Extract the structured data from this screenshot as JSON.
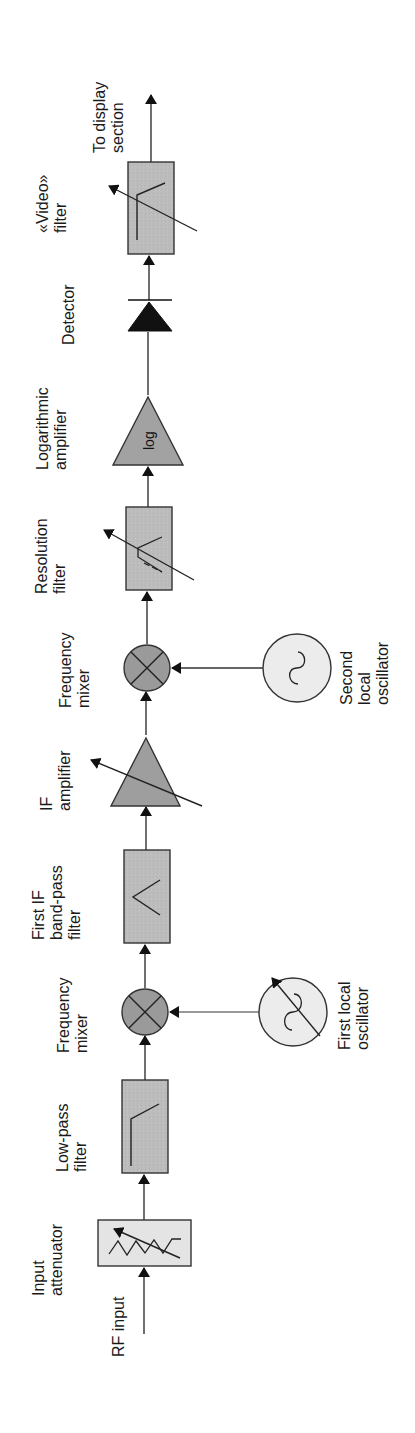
{
  "diagram": {
    "orientation": "rotated 90deg counter-clockwise; signal flows bottom to top",
    "colors": {
      "block_fill": "#b9b9b9",
      "attenuator_fill": "#e6e6e6",
      "oscillator_fill": "#eeeeee",
      "stroke": "#333333",
      "arrow": "#111111",
      "text": "#1a1a1a"
    },
    "nodes": [
      {
        "id": "rf_input",
        "lines": [
          "RF input"
        ]
      },
      {
        "id": "attenuator",
        "lines": [
          "Input",
          "attenuator"
        ],
        "symbol": "variable-attenuator"
      },
      {
        "id": "lpf",
        "lines": [
          "Low-pass",
          "filter"
        ],
        "symbol": "low-pass"
      },
      {
        "id": "mixer1",
        "lines": [
          "Frequency",
          "mixer"
        ],
        "symbol": "mixer"
      },
      {
        "id": "lo1",
        "lines": [
          "First local",
          "oscillator"
        ],
        "symbol": "variable-oscillator"
      },
      {
        "id": "bpf1",
        "lines": [
          "First IF",
          "band-pass",
          "filter"
        ],
        "symbol": "band-pass"
      },
      {
        "id": "if_amp",
        "lines": [
          "IF",
          "amplifier"
        ],
        "symbol": "variable-amplifier"
      },
      {
        "id": "mixer2",
        "lines": [
          "Frequency",
          "mixer"
        ],
        "symbol": "mixer"
      },
      {
        "id": "lo2",
        "lines": [
          "Second",
          "local",
          "oscillator"
        ],
        "symbol": "oscillator"
      },
      {
        "id": "res_filter",
        "lines": [
          "Resolution",
          "filter"
        ],
        "symbol": "variable-band-pass"
      },
      {
        "id": "log_amp",
        "lines": [
          "Logarithmic",
          "amplifier"
        ],
        "symbol": "log-amplifier",
        "inner_text": "log"
      },
      {
        "id": "detector",
        "lines": [
          "Detector"
        ],
        "symbol": "diode"
      },
      {
        "id": "video_filter",
        "lines": [
          "«Video»",
          "filter"
        ],
        "symbol": "variable-low-pass"
      },
      {
        "id": "output",
        "lines": [
          "To display",
          "section"
        ]
      }
    ],
    "edges": [
      [
        "rf_input",
        "attenuator"
      ],
      [
        "attenuator",
        "lpf"
      ],
      [
        "lpf",
        "mixer1"
      ],
      [
        "lo1",
        "mixer1"
      ],
      [
        "mixer1",
        "bpf1"
      ],
      [
        "bpf1",
        "if_amp"
      ],
      [
        "if_amp",
        "mixer2"
      ],
      [
        "lo2",
        "mixer2"
      ],
      [
        "mixer2",
        "res_filter"
      ],
      [
        "res_filter",
        "log_amp"
      ],
      [
        "log_amp",
        "detector"
      ],
      [
        "detector",
        "video_filter"
      ],
      [
        "video_filter",
        "output"
      ]
    ]
  }
}
